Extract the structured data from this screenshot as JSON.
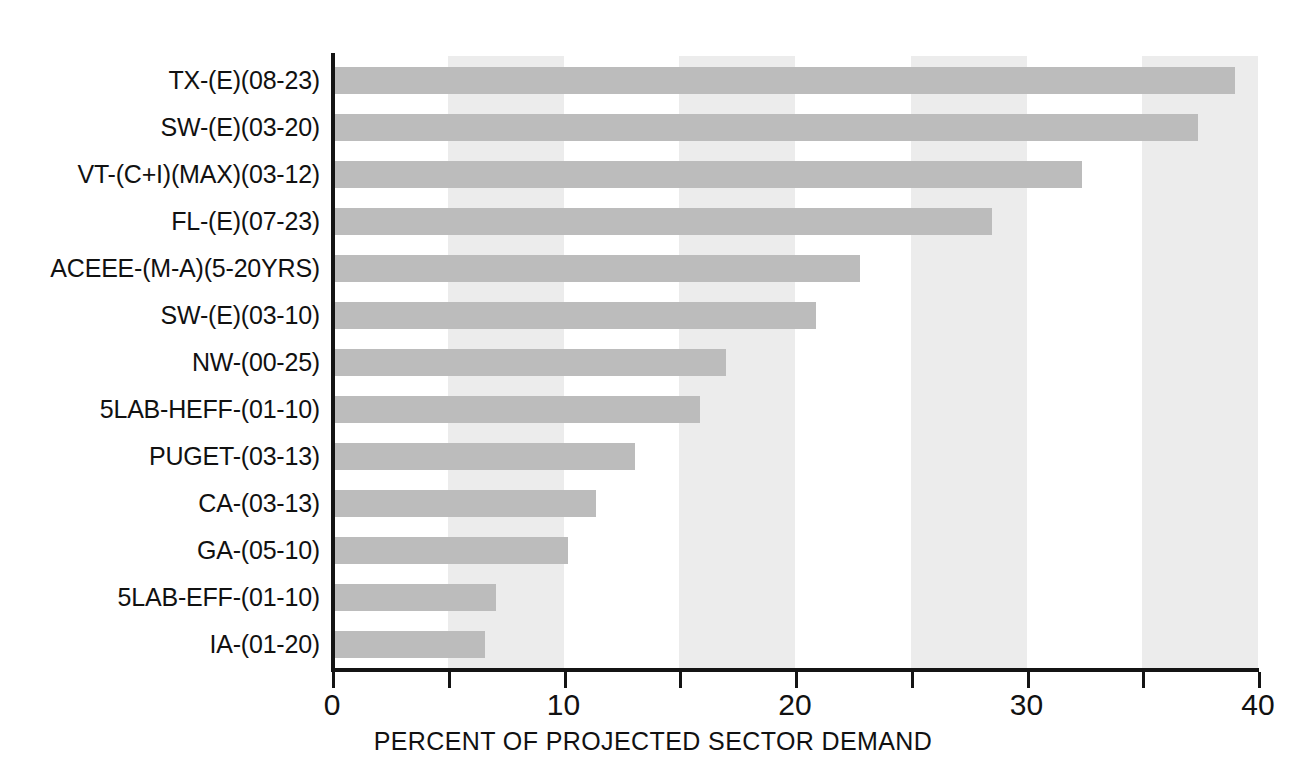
{
  "chart_data": {
    "type": "bar",
    "orientation": "horizontal",
    "title": "",
    "xlabel": "PERCENT OF PROJECTED SECTOR DEMAND",
    "ylabel": "",
    "xlim": [
      0,
      40
    ],
    "xticks": [
      0,
      10,
      20,
      30,
      40
    ],
    "xtick_labels": [
      "0",
      "10",
      "20",
      "30",
      "40"
    ],
    "minor_tick_interval": 5,
    "grid": false,
    "banding": {
      "description": "alternating light-gray vertical bands",
      "color": "#ececec",
      "ranges": [
        [
          5,
          10
        ],
        [
          15,
          20
        ],
        [
          25,
          30
        ],
        [
          35,
          40
        ]
      ]
    },
    "legend": null,
    "bar_color": "#bcbcbc",
    "categories": [
      "TX-(E)(08-23)",
      "SW-(E)(03-20)",
      "VT-(C+I)(MAX)(03-12)",
      "FL-(E)(07-23)",
      "ACEEE-(M-A)(5-20YRS)",
      "SW-(E)(03-10)",
      "NW-(00-25)",
      "5LAB-HEFF-(01-10)",
      "PUGET-(03-13)",
      "CA-(03-13)",
      "GA-(05-10)",
      "5LAB-EFF-(01-10)",
      "IA-(01-20)"
    ],
    "values": [
      39.0,
      37.4,
      32.4,
      28.5,
      22.8,
      20.9,
      17.0,
      15.9,
      13.1,
      11.4,
      10.2,
      7.1,
      6.6
    ]
  }
}
